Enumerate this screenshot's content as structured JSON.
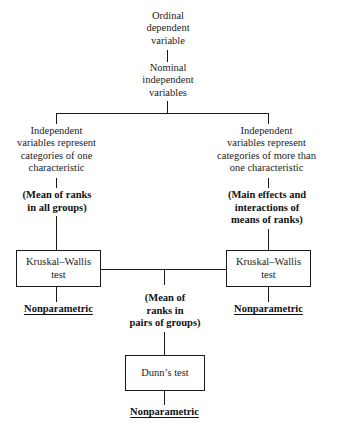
{
  "diagram": {
    "root": {
      "label": "Ordinal\ndependent\nvariable"
    },
    "second": {
      "label": "Nominal\nindependent\nvariables"
    },
    "branches": [
      {
        "id": "left",
        "condition": "Independent\nvariables represent\ncategories of one\ncharacteristic",
        "measure": "(Mean of ranks\nin all groups)",
        "test": "Kruskal–Wallis\ntest",
        "conclusion": "Nonparametric"
      },
      {
        "id": "right",
        "condition": "Independent\nvariables represent\ncategories of more than\none characteristic",
        "measure": "(Main effects and\ninteractions of\nmeans of ranks)",
        "test": "Kruskal–Wallis\ntest",
        "conclusion": "Nonparametric"
      }
    ],
    "posthoc": {
      "measure": "(Mean of\nranks in\npairs of groups)",
      "test": "Dunn’s test",
      "conclusion": "Nonparametric"
    },
    "colors": {
      "line": "#1a1a1a",
      "text": "#1c1c1c",
      "background": "#ffffff"
    }
  }
}
